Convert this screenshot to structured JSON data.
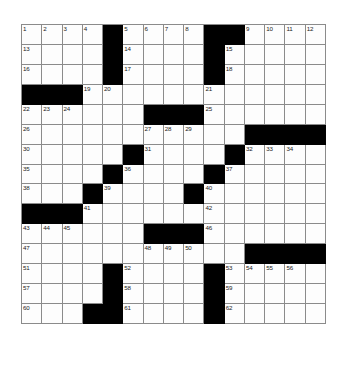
{
  "puzzle": {
    "type": "crossword-grid",
    "rows": 15,
    "columns": 15,
    "colors": {
      "block": "#000000",
      "cell": "#fdfdfd",
      "gridline": "#8b8b8b",
      "number": "#1a1a1a",
      "page_background": "#ffffff"
    },
    "grid": [
      [
        {
          "block": false,
          "number": "1"
        },
        {
          "block": false,
          "number": "2"
        },
        {
          "block": false,
          "number": "3"
        },
        {
          "block": false,
          "number": "4"
        },
        {
          "block": true,
          "number": ""
        },
        {
          "block": false,
          "number": "5"
        },
        {
          "block": false,
          "number": "6"
        },
        {
          "block": false,
          "number": "7"
        },
        {
          "block": false,
          "number": "8"
        },
        {
          "block": true,
          "number": ""
        },
        {
          "block": true,
          "number": ""
        },
        {
          "block": false,
          "number": "9"
        },
        {
          "block": false,
          "number": "10"
        },
        {
          "block": false,
          "number": "11"
        },
        {
          "block": false,
          "number": "12"
        }
      ],
      [
        {
          "block": false,
          "number": "13"
        },
        {
          "block": false,
          "number": ""
        },
        {
          "block": false,
          "number": ""
        },
        {
          "block": false,
          "number": ""
        },
        {
          "block": true,
          "number": ""
        },
        {
          "block": false,
          "number": "14"
        },
        {
          "block": false,
          "number": ""
        },
        {
          "block": false,
          "number": ""
        },
        {
          "block": false,
          "number": ""
        },
        {
          "block": true,
          "number": ""
        },
        {
          "block": false,
          "number": "15"
        },
        {
          "block": false,
          "number": ""
        },
        {
          "block": false,
          "number": ""
        },
        {
          "block": false,
          "number": ""
        },
        {
          "block": false,
          "number": ""
        }
      ],
      [
        {
          "block": false,
          "number": "16"
        },
        {
          "block": false,
          "number": ""
        },
        {
          "block": false,
          "number": ""
        },
        {
          "block": false,
          "number": ""
        },
        {
          "block": true,
          "number": ""
        },
        {
          "block": false,
          "number": "17"
        },
        {
          "block": false,
          "number": ""
        },
        {
          "block": false,
          "number": ""
        },
        {
          "block": false,
          "number": ""
        },
        {
          "block": true,
          "number": ""
        },
        {
          "block": false,
          "number": "18"
        },
        {
          "block": false,
          "number": ""
        },
        {
          "block": false,
          "number": ""
        },
        {
          "block": false,
          "number": ""
        },
        {
          "block": false,
          "number": ""
        }
      ],
      [
        {
          "block": true,
          "number": ""
        },
        {
          "block": true,
          "number": ""
        },
        {
          "block": true,
          "number": ""
        },
        {
          "block": false,
          "number": "19"
        },
        {
          "block": false,
          "number": "20"
        },
        {
          "block": false,
          "number": ""
        },
        {
          "block": false,
          "number": ""
        },
        {
          "block": false,
          "number": ""
        },
        {
          "block": false,
          "number": ""
        },
        {
          "block": false,
          "number": "21"
        },
        {
          "block": false,
          "number": ""
        },
        {
          "block": false,
          "number": ""
        },
        {
          "block": false,
          "number": ""
        },
        {
          "block": false,
          "number": ""
        },
        {
          "block": false,
          "number": ""
        }
      ],
      [
        {
          "block": false,
          "number": "22"
        },
        {
          "block": false,
          "number": "23"
        },
        {
          "block": false,
          "number": "24"
        },
        {
          "block": false,
          "number": ""
        },
        {
          "block": false,
          "number": ""
        },
        {
          "block": false,
          "number": ""
        },
        {
          "block": true,
          "number": ""
        },
        {
          "block": true,
          "number": ""
        },
        {
          "block": true,
          "number": ""
        },
        {
          "block": false,
          "number": "25"
        },
        {
          "block": false,
          "number": ""
        },
        {
          "block": false,
          "number": ""
        },
        {
          "block": false,
          "number": ""
        },
        {
          "block": false,
          "number": ""
        },
        {
          "block": false,
          "number": ""
        }
      ],
      [
        {
          "block": false,
          "number": "26"
        },
        {
          "block": false,
          "number": ""
        },
        {
          "block": false,
          "number": ""
        },
        {
          "block": false,
          "number": ""
        },
        {
          "block": false,
          "number": ""
        },
        {
          "block": false,
          "number": ""
        },
        {
          "block": false,
          "number": "27"
        },
        {
          "block": false,
          "number": "28"
        },
        {
          "block": false,
          "number": "29"
        },
        {
          "block": false,
          "number": ""
        },
        {
          "block": false,
          "number": ""
        },
        {
          "block": true,
          "number": ""
        },
        {
          "block": true,
          "number": ""
        },
        {
          "block": true,
          "number": ""
        },
        {
          "block": true,
          "number": ""
        }
      ],
      [
        {
          "block": false,
          "number": "30"
        },
        {
          "block": false,
          "number": ""
        },
        {
          "block": false,
          "number": ""
        },
        {
          "block": false,
          "number": ""
        },
        {
          "block": false,
          "number": ""
        },
        {
          "block": true,
          "number": ""
        },
        {
          "block": false,
          "number": "31"
        },
        {
          "block": false,
          "number": ""
        },
        {
          "block": false,
          "number": ""
        },
        {
          "block": false,
          "number": ""
        },
        {
          "block": true,
          "number": ""
        },
        {
          "block": false,
          "number": "32"
        },
        {
          "block": false,
          "number": "33"
        },
        {
          "block": false,
          "number": "34"
        },
        {
          "block": false,
          "number": ""
        }
      ],
      [
        {
          "block": false,
          "number": "35"
        },
        {
          "block": false,
          "number": ""
        },
        {
          "block": false,
          "number": ""
        },
        {
          "block": false,
          "number": ""
        },
        {
          "block": true,
          "number": ""
        },
        {
          "block": false,
          "number": "36"
        },
        {
          "block": false,
          "number": ""
        },
        {
          "block": false,
          "number": ""
        },
        {
          "block": false,
          "number": ""
        },
        {
          "block": true,
          "number": ""
        },
        {
          "block": false,
          "number": "37"
        },
        {
          "block": false,
          "number": ""
        },
        {
          "block": false,
          "number": ""
        },
        {
          "block": false,
          "number": ""
        },
        {
          "block": false,
          "number": ""
        }
      ],
      [
        {
          "block": false,
          "number": "38"
        },
        {
          "block": false,
          "number": ""
        },
        {
          "block": false,
          "number": ""
        },
        {
          "block": true,
          "number": ""
        },
        {
          "block": false,
          "number": "39"
        },
        {
          "block": false,
          "number": ""
        },
        {
          "block": false,
          "number": ""
        },
        {
          "block": false,
          "number": ""
        },
        {
          "block": true,
          "number": ""
        },
        {
          "block": false,
          "number": "40"
        },
        {
          "block": false,
          "number": ""
        },
        {
          "block": false,
          "number": ""
        },
        {
          "block": false,
          "number": ""
        },
        {
          "block": false,
          "number": ""
        },
        {
          "block": false,
          "number": ""
        }
      ],
      [
        {
          "block": true,
          "number": ""
        },
        {
          "block": true,
          "number": ""
        },
        {
          "block": true,
          "number": ""
        },
        {
          "block": false,
          "number": "41"
        },
        {
          "block": false,
          "number": ""
        },
        {
          "block": false,
          "number": ""
        },
        {
          "block": false,
          "number": ""
        },
        {
          "block": false,
          "number": ""
        },
        {
          "block": false,
          "number": ""
        },
        {
          "block": false,
          "number": "42"
        },
        {
          "block": false,
          "number": ""
        },
        {
          "block": false,
          "number": ""
        },
        {
          "block": false,
          "number": ""
        },
        {
          "block": false,
          "number": ""
        },
        {
          "block": false,
          "number": ""
        }
      ],
      [
        {
          "block": false,
          "number": "43"
        },
        {
          "block": false,
          "number": "44"
        },
        {
          "block": false,
          "number": "45"
        },
        {
          "block": false,
          "number": ""
        },
        {
          "block": false,
          "number": ""
        },
        {
          "block": false,
          "number": ""
        },
        {
          "block": true,
          "number": ""
        },
        {
          "block": true,
          "number": ""
        },
        {
          "block": true,
          "number": ""
        },
        {
          "block": false,
          "number": "46"
        },
        {
          "block": false,
          "number": ""
        },
        {
          "block": false,
          "number": ""
        },
        {
          "block": false,
          "number": ""
        },
        {
          "block": false,
          "number": ""
        },
        {
          "block": false,
          "number": ""
        }
      ],
      [
        {
          "block": false,
          "number": "47"
        },
        {
          "block": false,
          "number": ""
        },
        {
          "block": false,
          "number": ""
        },
        {
          "block": false,
          "number": ""
        },
        {
          "block": false,
          "number": ""
        },
        {
          "block": false,
          "number": ""
        },
        {
          "block": false,
          "number": "48"
        },
        {
          "block": false,
          "number": "49"
        },
        {
          "block": false,
          "number": "50"
        },
        {
          "block": false,
          "number": ""
        },
        {
          "block": false,
          "number": ""
        },
        {
          "block": true,
          "number": ""
        },
        {
          "block": true,
          "number": ""
        },
        {
          "block": true,
          "number": ""
        },
        {
          "block": true,
          "number": ""
        }
      ],
      [
        {
          "block": false,
          "number": "51"
        },
        {
          "block": false,
          "number": ""
        },
        {
          "block": false,
          "number": ""
        },
        {
          "block": false,
          "number": ""
        },
        {
          "block": true,
          "number": ""
        },
        {
          "block": false,
          "number": "52"
        },
        {
          "block": false,
          "number": ""
        },
        {
          "block": false,
          "number": ""
        },
        {
          "block": false,
          "number": ""
        },
        {
          "block": true,
          "number": ""
        },
        {
          "block": false,
          "number": "53"
        },
        {
          "block": false,
          "number": "54"
        },
        {
          "block": false,
          "number": "55"
        },
        {
          "block": false,
          "number": "56"
        },
        {
          "block": false,
          "number": ""
        }
      ],
      [
        {
          "block": false,
          "number": "57"
        },
        {
          "block": false,
          "number": ""
        },
        {
          "block": false,
          "number": ""
        },
        {
          "block": false,
          "number": ""
        },
        {
          "block": true,
          "number": ""
        },
        {
          "block": false,
          "number": "58"
        },
        {
          "block": false,
          "number": ""
        },
        {
          "block": false,
          "number": ""
        },
        {
          "block": false,
          "number": ""
        },
        {
          "block": true,
          "number": ""
        },
        {
          "block": false,
          "number": "59"
        },
        {
          "block": false,
          "number": ""
        },
        {
          "block": false,
          "number": ""
        },
        {
          "block": false,
          "number": ""
        },
        {
          "block": false,
          "number": ""
        }
      ],
      [
        {
          "block": false,
          "number": "60"
        },
        {
          "block": false,
          "number": ""
        },
        {
          "block": false,
          "number": ""
        },
        {
          "block": true,
          "number": ""
        },
        {
          "block": true,
          "number": ""
        },
        {
          "block": false,
          "number": "61"
        },
        {
          "block": false,
          "number": ""
        },
        {
          "block": false,
          "number": ""
        },
        {
          "block": false,
          "number": ""
        },
        {
          "block": true,
          "number": ""
        },
        {
          "block": false,
          "number": "62"
        },
        {
          "block": false,
          "number": ""
        },
        {
          "block": false,
          "number": ""
        },
        {
          "block": false,
          "number": ""
        },
        {
          "block": false,
          "number": ""
        }
      ]
    ]
  }
}
